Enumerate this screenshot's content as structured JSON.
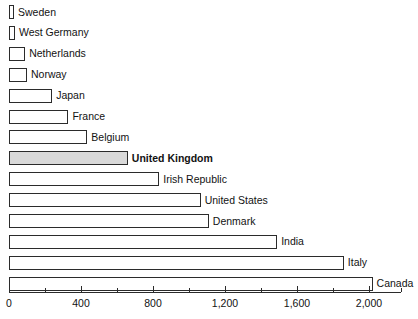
{
  "chart_data": {
    "type": "bar",
    "orientation": "horizontal",
    "title": "",
    "subtitle": "",
    "xlabel": "",
    "ylabel": "",
    "xlim": [
      0,
      2175
    ],
    "xticks": [
      0,
      400,
      800,
      1200,
      1600,
      2000
    ],
    "xtick_labels": [
      "0",
      "400",
      "800",
      "1,200",
      "1,600",
      "2,000"
    ],
    "minor_ticks": [
      200,
      600,
      1000,
      1400,
      1800,
      2175
    ],
    "grid": false,
    "legend": null,
    "categories": [
      "Sweden",
      "West Germany",
      "Netherlands",
      "Norway",
      "Japan",
      "France",
      "Belgium",
      "United Kingdom",
      "Irish Republic",
      "United States",
      "Denmark",
      "India",
      "Italy",
      "Canada"
    ],
    "values": [
      28,
      33,
      90,
      100,
      240,
      330,
      435,
      660,
      835,
      1065,
      1110,
      1490,
      1860,
      2020
    ],
    "highlight_category": "United Kingdom",
    "colors": {
      "bar_fill": "#ffffff",
      "bar_stroke": "#2b2b2b",
      "highlight_fill": "#d9d9d9",
      "text": "#121212",
      "axis": "#2b2b2b",
      "background": "#ffffff"
    }
  }
}
